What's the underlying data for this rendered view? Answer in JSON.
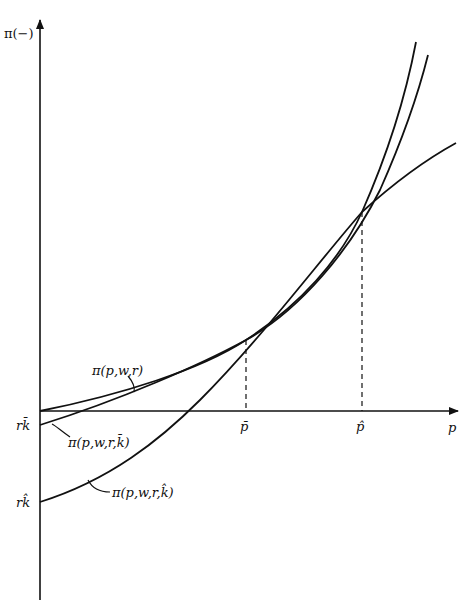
{
  "diagram": {
    "y_axis_label": "π(−)",
    "x_axis_label": "p",
    "x_ticks": [
      "p̄",
      "p̂"
    ],
    "y_ticks": [
      "rk̄",
      "rk̂"
    ],
    "curves": [
      {
        "name": "long-run",
        "label": "π(p,w,r)"
      },
      {
        "name": "short-run-kbar",
        "label": "π(p,w,r,k̄)"
      },
      {
        "name": "short-run-khat",
        "label": "π(p,w,r,k̂)"
      }
    ],
    "colors": {
      "ink": "#111111",
      "background": "#ffffff"
    }
  }
}
